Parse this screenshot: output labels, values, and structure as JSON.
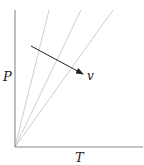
{
  "diagram": {
    "title": "",
    "axes": {
      "y_label": "P",
      "x_label": "T"
    },
    "isochores": {
      "count": 3,
      "color": "#c8c8c8",
      "origin": [
        15,
        147
      ],
      "endpoints": [
        [
          49,
          10
        ],
        [
          81,
          10
        ],
        [
          113,
          10
        ]
      ]
    },
    "arrow": {
      "label": "v",
      "from": [
        31,
        46
      ],
      "to": [
        83,
        74
      ],
      "color": "#222222"
    },
    "axis_color": "#888888"
  }
}
